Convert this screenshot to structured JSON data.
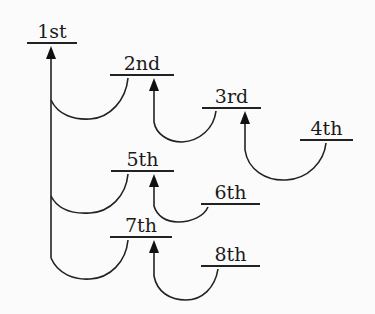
{
  "diagram": {
    "type": "tree",
    "nodes": [
      {
        "id": "n1",
        "label": "1st"
      },
      {
        "id": "n2",
        "label": "2nd"
      },
      {
        "id": "n3",
        "label": "3rd"
      },
      {
        "id": "n4",
        "label": "4th"
      },
      {
        "id": "n5",
        "label": "5th"
      },
      {
        "id": "n6",
        "label": "6th"
      },
      {
        "id": "n7",
        "label": "7th"
      },
      {
        "id": "n8",
        "label": "8th"
      }
    ],
    "edges": [
      {
        "from": "2nd",
        "to": "1st"
      },
      {
        "from": "5th",
        "to": "1st"
      },
      {
        "from": "7th",
        "to": "1st"
      },
      {
        "from": "3rd",
        "to": "2nd"
      },
      {
        "from": "4th",
        "to": "3rd"
      },
      {
        "from": "6th",
        "to": "5th"
      },
      {
        "from": "8th",
        "to": "7th"
      }
    ],
    "colors": {
      "background": "#fbfbfb",
      "stroke": "#222222"
    }
  }
}
